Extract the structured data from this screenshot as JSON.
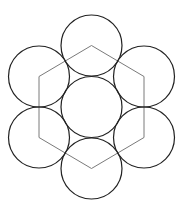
{
  "diagram": {
    "type": "geometric-figure",
    "canvas": {
      "width": 185,
      "height": 206,
      "background": "#ffffff"
    },
    "colors": {
      "circle_stroke": "#222222",
      "hexagon_stroke": "#7a7a7a"
    },
    "circles": [
      {
        "id": "center",
        "cx": 91.5,
        "cy": 107,
        "r": 30.5
      },
      {
        "id": "top",
        "cx": 91.5,
        "cy": 45.5,
        "r": 30.5
      },
      {
        "id": "upper-right",
        "cx": 144,
        "cy": 76.5,
        "r": 30.5
      },
      {
        "id": "lower-right",
        "cx": 144,
        "cy": 137.5,
        "r": 30.5
      },
      {
        "id": "bottom",
        "cx": 91.5,
        "cy": 168.5,
        "r": 30.5
      },
      {
        "id": "lower-left",
        "cx": 39,
        "cy": 137.5,
        "r": 30.5
      },
      {
        "id": "upper-left",
        "cx": 39,
        "cy": 76.5,
        "r": 30.5
      }
    ],
    "hexagon": {
      "points": [
        [
          91.5,
          45.5
        ],
        [
          144,
          76.5
        ],
        [
          144,
          137.5
        ],
        [
          91.5,
          168.5
        ],
        [
          39,
          137.5
        ],
        [
          39,
          76.5
        ]
      ]
    }
  }
}
